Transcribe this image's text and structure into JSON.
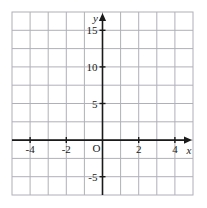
{
  "chart_data": {
    "type": "line",
    "title": "",
    "xlabel": "x",
    "ylabel": "y",
    "xlim": [
      -5,
      5
    ],
    "ylim": [
      -7.5,
      17.5
    ],
    "grid": true,
    "legend": "none",
    "origin_label": "O",
    "xticks": [
      -4,
      -2,
      2,
      4
    ],
    "xtick_labels": [
      "-4",
      "-2",
      "2",
      "4"
    ],
    "yticks": [
      15,
      10,
      5,
      -5
    ],
    "ytick_labels": [
      "15",
      "10",
      "5",
      "-5"
    ],
    "x_minor_step": 1,
    "y_minor_step": 2.5,
    "series": [
      {
        "name": "upper",
        "equation": "y = x^2 + 4",
        "a": 1,
        "h": 0,
        "k": 4,
        "vertex": [
          0,
          4
        ],
        "x": [
          -3.6,
          -3.0,
          -2.4,
          -1.8,
          -1.2,
          -0.6,
          0,
          0.6,
          1.2,
          1.8,
          2.4,
          3.0,
          3.6
        ],
        "y": [
          16.96,
          13.0,
          9.76,
          7.24,
          5.44,
          4.36,
          4.0,
          4.36,
          5.44,
          7.24,
          9.76,
          13.0,
          16.96
        ]
      },
      {
        "name": "upper-middle",
        "equation": "y = x^2 + 1",
        "a": 1,
        "h": 0,
        "k": 1,
        "vertex": [
          0,
          1
        ],
        "x": [
          -4.0,
          -3.4,
          -2.8,
          -2.2,
          -1.6,
          -1.0,
          0,
          1.0,
          1.6,
          2.2,
          2.8,
          3.4,
          4.0
        ],
        "y": [
          17.0,
          12.56,
          8.84,
          5.84,
          3.56,
          2.0,
          1.0,
          2.0,
          3.56,
          5.84,
          8.84,
          12.56,
          17.0
        ]
      },
      {
        "name": "lower-middle",
        "equation": "y = x^2 - 1",
        "a": 1,
        "h": 0,
        "k": -1,
        "vertex": [
          0,
          -1
        ],
        "x": [
          -4.2,
          -3.6,
          -3.0,
          -2.4,
          -1.8,
          -1.2,
          0,
          1.2,
          1.8,
          2.4,
          3.0,
          3.6,
          4.2
        ],
        "y": [
          16.64,
          11.96,
          8.0,
          4.76,
          2.24,
          0.44,
          -1.0,
          0.44,
          2.24,
          4.76,
          8.0,
          11.96,
          16.64
        ]
      },
      {
        "name": "lower",
        "equation": "y = x^2 - 4",
        "a": 1,
        "h": 0,
        "k": -4,
        "vertex": [
          0,
          -4
        ],
        "x": [
          -4.5,
          -3.9,
          -3.3,
          -2.7,
          -2.1,
          -1.5,
          0,
          1.5,
          2.1,
          2.7,
          3.3,
          3.9,
          4.5
        ],
        "y": [
          16.25,
          11.21,
          6.89,
          3.29,
          0.41,
          -1.75,
          -4.0,
          -1.75,
          0.41,
          3.29,
          6.89,
          11.21,
          16.25
        ]
      }
    ],
    "colors": {
      "curve": "#1a1a1a",
      "axis": "#1a1a1a",
      "grid": "#b0b0b8",
      "background": "#ffffff",
      "frame": "#b0b0b8"
    }
  }
}
